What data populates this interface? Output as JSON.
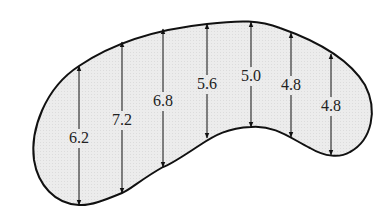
{
  "diagram": {
    "shape": "kidney-shaped region",
    "fill_color": "#ececec",
    "stroke_color": "#111111",
    "measurements": [
      {
        "label": "6.2",
        "x": 79,
        "top": 66,
        "bottom": 205,
        "label_y": 143
      },
      {
        "label": "7.2",
        "x": 122,
        "top": 42,
        "bottom": 193,
        "label_y": 125
      },
      {
        "label": "6.8",
        "x": 163,
        "top": 29,
        "bottom": 167,
        "label_y": 106
      },
      {
        "label": "5.6",
        "x": 207,
        "top": 24,
        "bottom": 138,
        "label_y": 89
      },
      {
        "label": "5.0",
        "x": 251,
        "top": 22,
        "bottom": 127,
        "label_y": 81
      },
      {
        "label": "4.8",
        "x": 291,
        "top": 33,
        "bottom": 137,
        "label_y": 90
      },
      {
        "label": "4.8",
        "x": 331,
        "top": 54,
        "bottom": 155,
        "label_y": 111
      }
    ]
  }
}
